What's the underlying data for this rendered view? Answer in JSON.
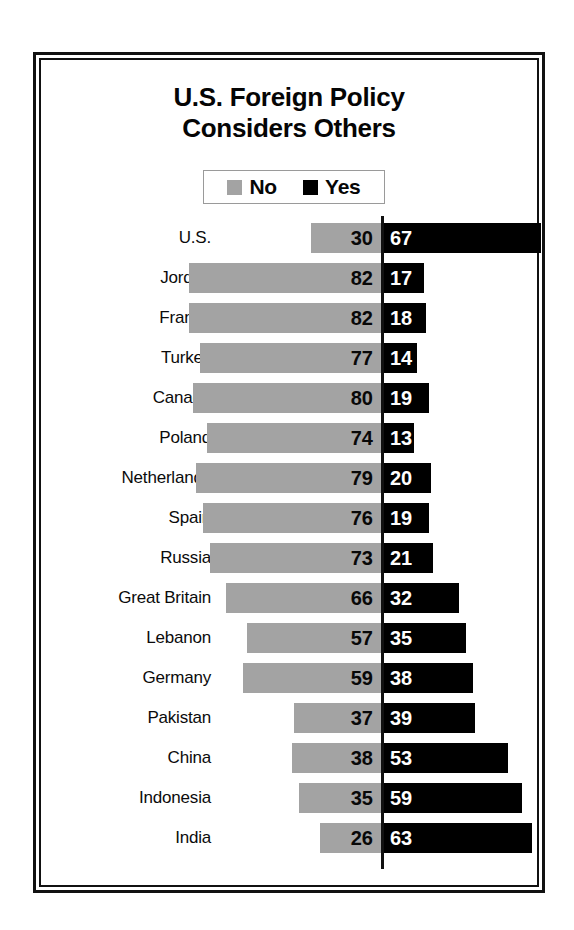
{
  "chart_data": {
    "type": "bar",
    "subtype": "diverging-horizontal-bar",
    "title": "U.S. Foreign Policy Considers Others",
    "title_lines": [
      "U.S. Foreign Policy",
      "Considers Others"
    ],
    "xlabel": "",
    "ylabel": "",
    "grid": false,
    "legend_position": "top-center",
    "axis_center_value": 0,
    "xlim": [
      -100,
      100
    ],
    "units": "percent",
    "categories": [
      "U.S.",
      "Jordan",
      "France",
      "Turkey",
      "Canada",
      "Poland",
      "Netherlands",
      "Spain",
      "Russia",
      "Great Britain",
      "Lebanon",
      "Germany",
      "Pakistan",
      "China",
      "Indonesia",
      "India"
    ],
    "series": [
      {
        "name": "No",
        "color": "#a3a3a3",
        "direction": "left",
        "values": [
          30,
          82,
          82,
          77,
          80,
          74,
          79,
          76,
          73,
          66,
          57,
          59,
          37,
          38,
          35,
          26
        ]
      },
      {
        "name": "Yes",
        "color": "#000000",
        "direction": "right",
        "values": [
          67,
          17,
          18,
          14,
          19,
          13,
          20,
          19,
          21,
          32,
          35,
          38,
          39,
          53,
          59,
          63
        ]
      }
    ]
  },
  "legend": {
    "items": [
      {
        "label": "No",
        "color": "#a3a3a3"
      },
      {
        "label": "Yes",
        "color": "#000000"
      }
    ]
  },
  "style": {
    "gray": "#a3a3a3",
    "black": "#000000",
    "frame": "#111111",
    "background": "#ffffff"
  }
}
